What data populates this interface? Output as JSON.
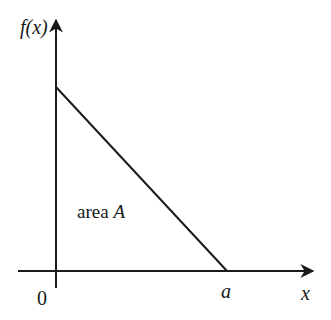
{
  "diagram": {
    "y_axis_label": "f(x)",
    "x_axis_label": "x",
    "origin_label": "0",
    "x_intercept_label": "a",
    "region_label_prefix": "area ",
    "region_label_var": "A",
    "line_color": "#1a1a1a",
    "shape": "right triangle under decreasing line from (0, f(0)) to (a, 0)"
  }
}
